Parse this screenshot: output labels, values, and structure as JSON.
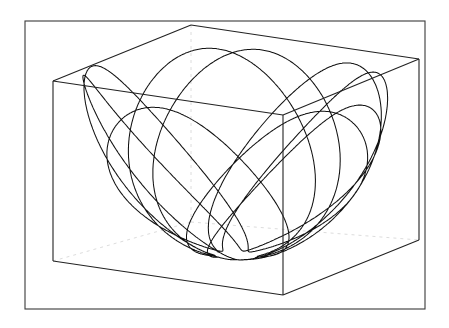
{
  "figure": {
    "curve": {
      "kind": "spherical-pendulum-path",
      "lobes_visible": 9,
      "precession_turns": 3
    },
    "colors": {
      "background": "#ffffff",
      "curve": "#111111",
      "box_edges": "#222222",
      "hidden_edges": "#d8d8d8",
      "frame": "#3a3a3a"
    }
  }
}
